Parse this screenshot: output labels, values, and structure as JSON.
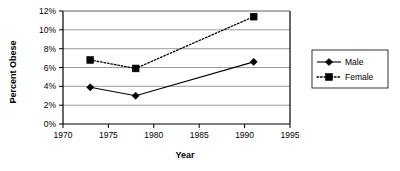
{
  "chart_data": {
    "type": "line",
    "title": "",
    "xlabel": "Year",
    "ylabel": "Percent Obese",
    "xlim": [
      1970,
      1995
    ],
    "ylim": [
      0,
      12
    ],
    "xticks": [
      1970,
      1975,
      1980,
      1985,
      1990,
      1995
    ],
    "xtick_labels": [
      "1970",
      "1975",
      "1980",
      "1985",
      "1990",
      "1995"
    ],
    "yticks": [
      0,
      2,
      4,
      6,
      8,
      10,
      12
    ],
    "ytick_labels": [
      "0%",
      "2%",
      "4%",
      "6%",
      "8%",
      "10%",
      "12%"
    ],
    "grid": "horizontal",
    "legend_position": "right",
    "x": [
      1973,
      1978,
      1991
    ],
    "series": [
      {
        "name": "Male",
        "label": "Male",
        "marker": "diamond",
        "linestyle": "solid",
        "color": "#000000",
        "values": [
          3.9,
          3.0,
          6.6
        ]
      },
      {
        "name": "Female",
        "label": "Female",
        "marker": "square",
        "linestyle": "dotted",
        "color": "#000000",
        "values": [
          6.8,
          5.9,
          11.4
        ]
      }
    ]
  },
  "legend": {
    "items": [
      {
        "label": "Male"
      },
      {
        "label": "Female"
      }
    ]
  },
  "axes": {
    "y_title": "Percent Obese",
    "x_title": "Year"
  }
}
